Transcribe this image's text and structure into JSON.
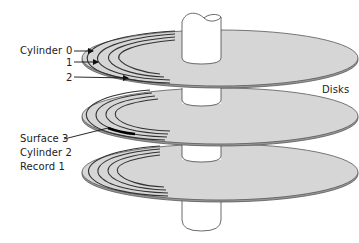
{
  "diagram": {
    "labels": {
      "cylinder": "Cylinder",
      "cyl0": "0",
      "cyl1": "1",
      "cyl2": "2",
      "surface": "Surface 3",
      "cylinder_ref": "Cylinder 2",
      "record": "Record 1",
      "disks": "Disks"
    },
    "colors": {
      "disk_fill": "#d6d6d6",
      "disk_edge": "#555555",
      "track_line": "#333333",
      "spindle_fill": "#ffffff",
      "text": "#222222"
    },
    "disks": [
      {
        "name": "disk-1",
        "cx": 220,
        "cy": 58
      },
      {
        "name": "disk-2",
        "cx": 220,
        "cy": 116
      },
      {
        "name": "disk-3",
        "cx": 220,
        "cy": 172
      }
    ]
  }
}
